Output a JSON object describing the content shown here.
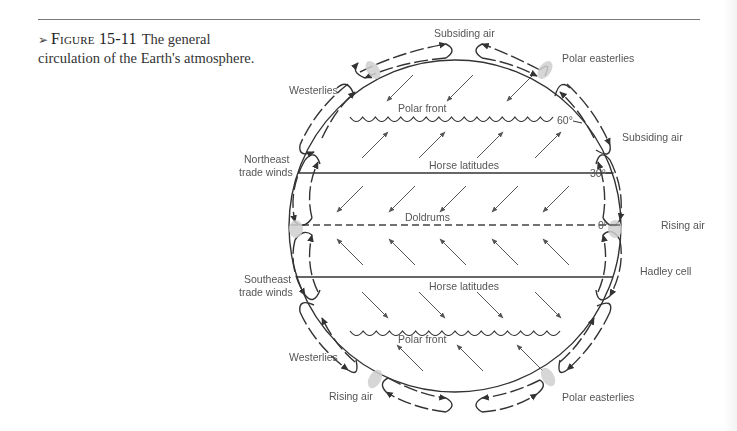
{
  "caption": {
    "marker": "➢",
    "figure_number": "Figure 15-11",
    "text": "The general circulation of the Earth's atmosphere."
  },
  "diagram": {
    "latitude_labels": {
      "lat60": "60°",
      "lat30": "30°",
      "lat0": "0°"
    },
    "inner_labels": {
      "polar_front_north": "Polar front",
      "horse_latitudes_north": "Horse latitudes",
      "doldrums": "Doldrums",
      "horse_latitudes_south": "Horse latitudes",
      "polar_front_south": "Polar front"
    },
    "outer_labels": {
      "subsiding_air_top": "Subsiding air",
      "polar_easterlies_top": "Polar easterlies",
      "westerlies_top": "Westerlies",
      "subsiding_air_right": "Subsiding air",
      "northeast_trade_winds_line1": "Northeast",
      "northeast_trade_winds_line2": "trade winds",
      "rising_air_right": "Rising air",
      "southeast_trade_winds_line1": "Southeast",
      "southeast_trade_winds_line2": "trade winds",
      "hadley_cell": "Hadley cell",
      "westerlies_bottom": "Westerlies",
      "rising_air_bottom": "Rising air",
      "polar_easterlies_bottom": "Polar easterlies"
    },
    "wind_zones": [
      {
        "name": "polar-north",
        "direction": "southwest",
        "count": 3
      },
      {
        "name": "westerlies-north",
        "direction": "northeast",
        "count": 4
      },
      {
        "name": "trades-north",
        "direction": "southwest",
        "count": 5
      },
      {
        "name": "trades-south",
        "direction": "northwest",
        "count": 5
      },
      {
        "name": "westerlies-south",
        "direction": "southeast",
        "count": 4
      },
      {
        "name": "polar-south",
        "direction": "northwest",
        "count": 3
      }
    ]
  }
}
